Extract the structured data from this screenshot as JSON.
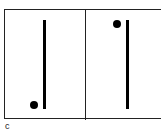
{
  "figure": {
    "label": "c",
    "panels": [
      {
        "id": "left",
        "dot_position": "bottom-left of line"
      },
      {
        "id": "right",
        "dot_position": "top-left of line"
      }
    ]
  }
}
